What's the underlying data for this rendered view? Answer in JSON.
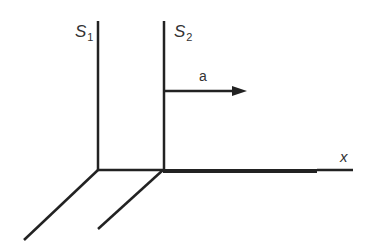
{
  "diagram": {
    "frames": [
      {
        "name": "S",
        "subscript": "1"
      },
      {
        "name": "S",
        "subscript": "2"
      }
    ],
    "acceleration_label": "a",
    "x_axis_label": "x",
    "line_color": "#222222"
  }
}
